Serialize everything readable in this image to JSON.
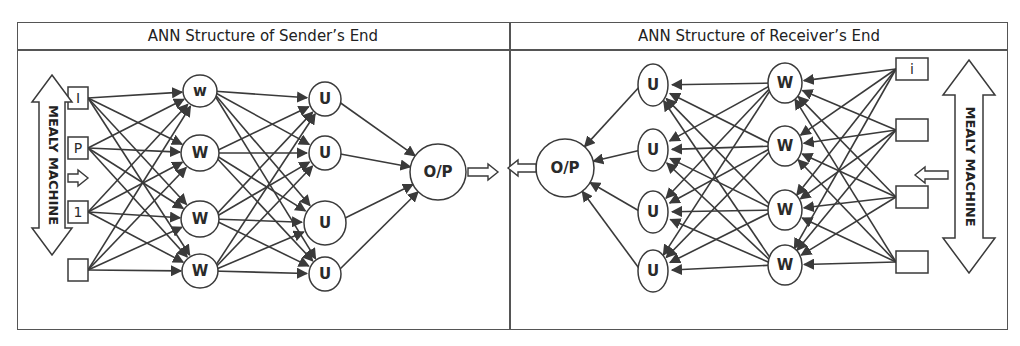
{
  "headers": {
    "sender": "ANN Structure of Sender’s End",
    "receiver": "ANN Structure of Receiver’s End"
  },
  "sender": {
    "mealy_label": "MEALY MACHINE",
    "inputs": [
      {
        "label": "I",
        "y": 98
      },
      {
        "label": "P",
        "y": 148
      },
      {
        "label": "1",
        "y": 212
      },
      {
        "label": "",
        "y": 270
      }
    ],
    "hidden_w": [
      {
        "label": "w",
        "y": 91
      },
      {
        "label": "W",
        "y": 153
      },
      {
        "label": "W",
        "y": 219
      },
      {
        "label": "W",
        "y": 271
      }
    ],
    "hidden_u": [
      {
        "label": "U",
        "y": 99
      },
      {
        "label": "U",
        "y": 153
      },
      {
        "label": "U",
        "y": 223
      },
      {
        "label": "U",
        "y": 274
      }
    ],
    "output": {
      "label": "O/P"
    }
  },
  "receiver": {
    "mealy_label": "MEALY MACHINE",
    "inputs": [
      {
        "label": "i",
        "y": 69
      },
      {
        "label": "",
        "y": 130
      },
      {
        "label": "",
        "y": 197
      },
      {
        "label": "",
        "y": 262
      }
    ],
    "hidden_w": [
      {
        "label": "W",
        "y": 83
      },
      {
        "label": "W",
        "y": 146
      },
      {
        "label": "W",
        "y": 210
      },
      {
        "label": "W",
        "y": 265
      }
    ],
    "hidden_u": [
      {
        "label": "U",
        "y": 85
      },
      {
        "label": "U",
        "y": 150
      },
      {
        "label": "U",
        "y": 212
      },
      {
        "label": "U",
        "y": 271
      }
    ],
    "output": {
      "label": "O/P"
    }
  },
  "colors": {
    "stroke": "#3a3a3a",
    "border": "#555555",
    "background": "#ffffff"
  }
}
